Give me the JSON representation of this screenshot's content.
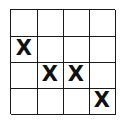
{
  "grid": {
    "rows": 4,
    "cols": 4,
    "cells": [
      [
        "",
        "",
        "",
        ""
      ],
      [
        "X",
        "",
        "",
        ""
      ],
      [
        "",
        "X",
        "X",
        ""
      ],
      [
        "",
        "",
        "",
        "X"
      ]
    ]
  }
}
